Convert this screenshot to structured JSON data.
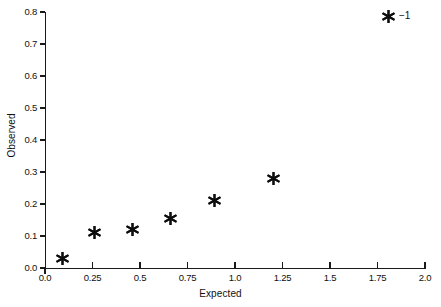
{
  "chart_data": {
    "type": "scatter",
    "title": "",
    "xlabel": "Expected",
    "ylabel": "Observed",
    "xlim": [
      0.0,
      2.0
    ],
    "ylim": [
      0.0,
      0.8
    ],
    "grid": false,
    "legend_position": "top-right",
    "legend": [
      {
        "label": "−1",
        "marker": "asterisk",
        "color": "#0d0d0d"
      }
    ],
    "xticks": [
      "0.0",
      "0.25",
      "0.5",
      "0.75",
      "1.0",
      "1.25",
      "1.5",
      "1.75",
      "2.0"
    ],
    "xtick_values": [
      0.0,
      0.25,
      0.5,
      0.75,
      1.0,
      1.25,
      1.5,
      1.75,
      2.0
    ],
    "yticks": [
      "0.0",
      "0.1",
      "0.2",
      "0.3",
      "0.4",
      "0.5",
      "0.6",
      "0.7",
      "0.8"
    ],
    "ytick_values": [
      0.0,
      0.1,
      0.2,
      0.3,
      0.4,
      0.5,
      0.6,
      0.7,
      0.8
    ],
    "series": [
      {
        "name": "−1",
        "marker": "asterisk",
        "color": "#0d0d0d",
        "points": [
          {
            "x": 0.09,
            "y": 0.03
          },
          {
            "x": 0.26,
            "y": 0.112
          },
          {
            "x": 0.46,
            "y": 0.121
          },
          {
            "x": 0.66,
            "y": 0.155
          },
          {
            "x": 0.89,
            "y": 0.212
          },
          {
            "x": 1.2,
            "y": 0.28
          }
        ]
      }
    ]
  },
  "colors": {
    "axis": "#1a1a1a",
    "marker": "#0d0d0d",
    "text": "#111111",
    "background": "#ffffff"
  }
}
